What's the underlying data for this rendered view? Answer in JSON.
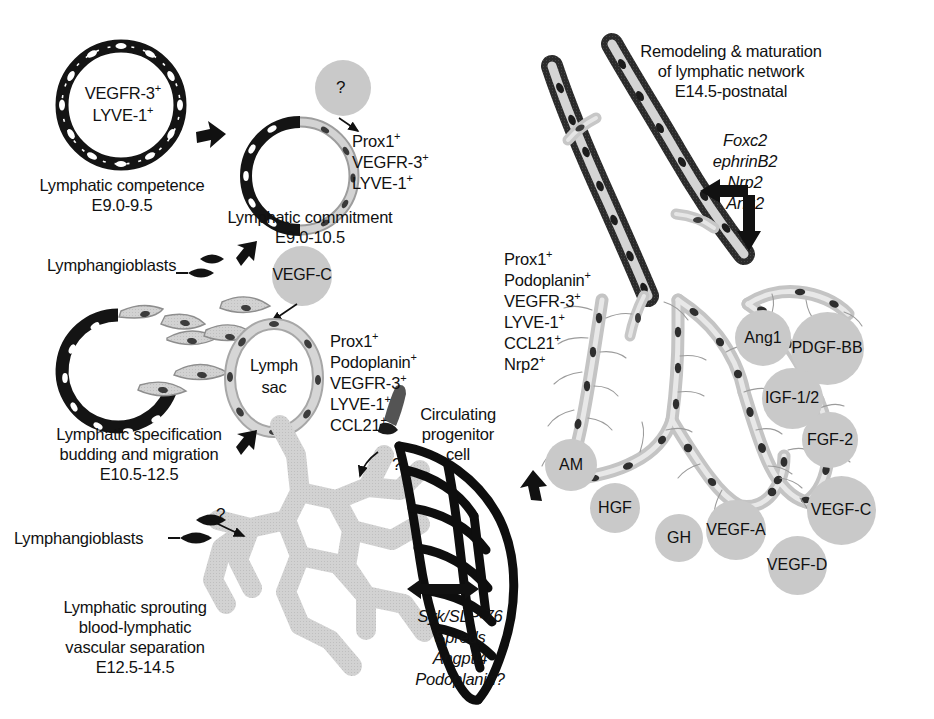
{
  "figure": {
    "background": "#ffffff",
    "ink": "#111111",
    "circle_fill": "#c9c9c9",
    "vessel_light": "#cfcfcf",
    "vessel_dark": "#262626"
  },
  "left_panel": {
    "stage1": {
      "ring_markers": [
        "VEGFR-3",
        "LYVE-1"
      ],
      "ring_marker_sup": "+",
      "caption_line1": "Lymphatic competence",
      "caption_line2": "E9.0-9.5"
    },
    "stage2": {
      "unknown_signal": "?",
      "markers": [
        "Prox1",
        "VEGFR-3",
        "LYVE-1"
      ],
      "marker_sup": "+",
      "caption_line1": "Lymphatic commitment",
      "caption_line2": "E9.0-10.5"
    },
    "stage3": {
      "lymphangioblasts_label": "Lymphangioblasts",
      "growth_factor": "VEGF-C",
      "sac_label_line1": "Lymph",
      "sac_label_line2": "sac",
      "markers": [
        "Prox1",
        "Podoplanin",
        "VEGFR-3",
        "LYVE-1",
        "CCL21"
      ],
      "marker_sup": "+",
      "caption_line1": "Lymphatic specification",
      "caption_line2": "budding and migration",
      "caption_line3": "E10.5-12.5"
    },
    "stage4": {
      "lymphangioblasts_label": "Lymphangioblasts",
      "unknown_1": "?",
      "unknown_2": "?",
      "progenitor_line1": "Circulating",
      "progenitor_line2": "progenitor",
      "progenitor_line3": "cell",
      "separation_genes": [
        "Syk/SLP-76",
        "Spreds",
        "Angptl4",
        "Podoplanin?"
      ],
      "caption_line1": "Lymphatic sprouting",
      "caption_line2": "blood-lymphatic",
      "caption_line3": "vascular separation",
      "caption_line4": "E12.5-14.5"
    }
  },
  "right_panel": {
    "heading_line1": "Remodeling & maturation",
    "heading_line2": "of lymphatic network",
    "heading_line3": "E14.5-postnatal",
    "remodeling_genes": [
      "Foxc2",
      "ephrinB2",
      "Nrp2",
      "Ang2"
    ],
    "markers": [
      "Prox1",
      "Podoplanin",
      "VEGFR-3",
      "LYVE-1",
      "CCL21",
      "Nrp2"
    ],
    "marker_sup": "+",
    "growth_factors": [
      {
        "label": "Ang1",
        "x": 763,
        "y": 338,
        "d": 56
      },
      {
        "label": "PDGF-BB",
        "x": 827,
        "y": 348,
        "d": 73
      },
      {
        "label": "IGF-1/2",
        "x": 792,
        "y": 398,
        "d": 61
      },
      {
        "label": "FGF-2",
        "x": 830,
        "y": 440,
        "d": 56
      },
      {
        "label": "AM",
        "x": 571,
        "y": 465,
        "d": 52
      },
      {
        "label": "VEGF-C",
        "x": 841,
        "y": 510,
        "d": 69
      },
      {
        "label": "HGF",
        "x": 615,
        "y": 508,
        "d": 50
      },
      {
        "label": "GH",
        "x": 679,
        "y": 538,
        "d": 48
      },
      {
        "label": "VEGF-A",
        "x": 736,
        "y": 530,
        "d": 60
      },
      {
        "label": "VEGF-D",
        "x": 797,
        "y": 565,
        "d": 59
      }
    ]
  }
}
